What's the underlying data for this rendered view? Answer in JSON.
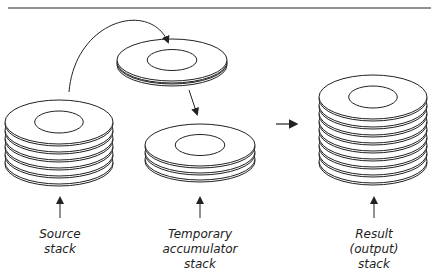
{
  "diagram": {
    "stacks": [
      {
        "id": "source",
        "label": [
          "Source",
          "stack"
        ],
        "plates": 6
      },
      {
        "id": "temporary",
        "label": [
          "Temporary",
          "accumulator",
          "stack"
        ],
        "plates": 3
      },
      {
        "id": "result",
        "label": [
          "Result",
          "(output)",
          "stack"
        ],
        "plates": 9
      }
    ],
    "moving_plate": {
      "plates": 2
    },
    "colors": {
      "line": "#222222",
      "background": "#ffffff"
    }
  }
}
